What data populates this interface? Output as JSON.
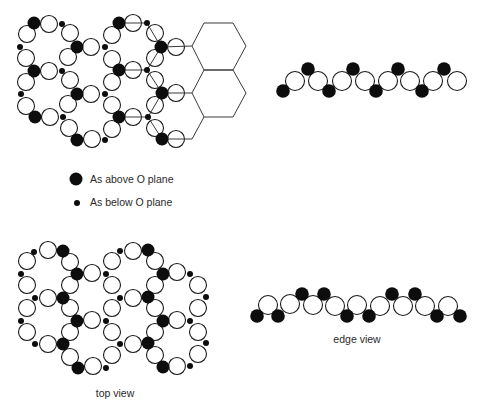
{
  "colors": {
    "background": "#ffffff",
    "atom_fill_dark": "#0d0d0d",
    "open_atom_stroke": "#1a1a1a",
    "open_atom_fill": "#ffffff",
    "bond_line": "#3a3a3a",
    "text": "#2a2a2a"
  },
  "legend": {
    "above_label": "As above O plane",
    "below_label": "As below O plane",
    "above_marker": {
      "x": 76,
      "y": 179,
      "r": 6.5
    },
    "below_marker": {
      "x": 77,
      "y": 203,
      "r": 3
    }
  },
  "labels": {
    "top_view": "top view",
    "edge_view": "edge view"
  },
  "diagram": {
    "groups": [
      {
        "name": "upper-top-view",
        "radii": {
          "open": 8.5,
          "above": 6.5,
          "below": 3
        },
        "open": [
          [
            49,
            24
          ],
          [
            49,
            71
          ],
          [
            50,
            117
          ],
          [
            27,
            34
          ],
          [
            26,
            58
          ],
          [
            26,
            82
          ],
          [
            26,
            106
          ],
          [
            70,
            33
          ],
          [
            68,
            57
          ],
          [
            70,
            80
          ],
          [
            68,
            104
          ],
          [
            69,
            128
          ],
          [
            91,
            47
          ],
          [
            91,
            94
          ],
          [
            92,
            139
          ],
          [
            112,
            35
          ],
          [
            112,
            59
          ],
          [
            112,
            82
          ],
          [
            112,
            105
          ],
          [
            112,
            129
          ],
          [
            133,
            23
          ],
          [
            133,
            70
          ],
          [
            133,
            117
          ],
          [
            155,
            33
          ],
          [
            155,
            58
          ],
          [
            155,
            80
          ],
          [
            155,
            105
          ],
          [
            155,
            128
          ],
          [
            176,
            47
          ],
          [
            176,
            93
          ],
          [
            176,
            139
          ]
        ],
        "above": [
          [
            34,
            23
          ],
          [
            77,
            47
          ],
          [
            34,
            71
          ],
          [
            77,
            94
          ],
          [
            35,
            117
          ],
          [
            77,
            140
          ],
          [
            119,
            23
          ],
          [
            161,
            47
          ],
          [
            119,
            70
          ],
          [
            162,
            93
          ],
          [
            119,
            117
          ],
          [
            162,
            139
          ]
        ],
        "below": [
          [
            62,
            24
          ],
          [
            20,
            47
          ],
          [
            62,
            71
          ],
          [
            21,
            94
          ],
          [
            63,
            117
          ],
          [
            105,
            140
          ],
          [
            147,
            23
          ],
          [
            105,
            47
          ],
          [
            147,
            70
          ],
          [
            105,
            94
          ],
          [
            148,
            117
          ]
        ],
        "bonds": [
          [
            119,
            23,
            147,
            23
          ],
          [
            147,
            23,
            161,
            47
          ],
          [
            161,
            47,
            147,
            70
          ],
          [
            119,
            70,
            147,
            70
          ],
          [
            147,
            70,
            162,
            93
          ],
          [
            162,
            93,
            148,
            117
          ],
          [
            119,
            117,
            148,
            117
          ],
          [
            148,
            117,
            162,
            139
          ],
          [
            161,
            47,
            192,
            46
          ],
          [
            162,
            93,
            192,
            93
          ],
          [
            162,
            139,
            192,
            139
          ],
          [
            204,
            117,
            192,
            139
          ]
        ],
        "hexagons": [
          [
            [
              192,
              46
            ],
            [
              204,
              23
            ],
            [
              233,
              23
            ],
            [
              246,
              46
            ],
            [
              233,
              70
            ],
            [
              204,
              70
            ]
          ],
          [
            [
              204,
              70
            ],
            [
              233,
              70
            ],
            [
              246,
              93
            ],
            [
              233,
              117
            ],
            [
              204,
              117
            ],
            [
              192,
              93
            ]
          ]
        ]
      },
      {
        "name": "upper-edge-view",
        "radii": {
          "open": 9.5,
          "above": 6.8,
          "below": 6.8
        },
        "open": [
          [
            295,
            81
          ],
          [
            318,
            81
          ],
          [
            342,
            81
          ],
          [
            365,
            81
          ],
          [
            388,
            81
          ],
          [
            410,
            81
          ],
          [
            433,
            81
          ],
          [
            457,
            81
          ]
        ],
        "above": [
          [
            308,
            69
          ],
          [
            353,
            69
          ],
          [
            398,
            69
          ],
          [
            444,
            69
          ]
        ],
        "below_dark": [
          [
            283,
            91
          ],
          [
            329,
            91
          ],
          [
            376,
            91
          ],
          [
            422,
            91
          ]
        ],
        "below": [],
        "bonds": [],
        "hexagons": []
      },
      {
        "name": "lower-top-view",
        "radii": {
          "open": 8.5,
          "above": 6.5,
          "below": 3
        },
        "open": [
          [
            48,
            250
          ],
          [
            27,
            261
          ],
          [
            70,
            262
          ],
          [
            92,
            273
          ],
          [
            27,
            285
          ],
          [
            70,
            285
          ],
          [
            48,
            298
          ],
          [
            27,
            308
          ],
          [
            70,
            308
          ],
          [
            92,
            320
          ],
          [
            27,
            332
          ],
          [
            70,
            332
          ],
          [
            48,
            344
          ],
          [
            70,
            357
          ],
          [
            93,
            366
          ],
          [
            133,
            251
          ],
          [
            112,
            261
          ],
          [
            155,
            261
          ],
          [
            177,
            272
          ],
          [
            112,
            285
          ],
          [
            155,
            285
          ],
          [
            133,
            298
          ],
          [
            112,
            308
          ],
          [
            155,
            308
          ],
          [
            177,
            320
          ],
          [
            112,
            332
          ],
          [
            155,
            332
          ],
          [
            133,
            344
          ],
          [
            112,
            355
          ],
          [
            155,
            355
          ],
          [
            177,
            366
          ],
          [
            198,
            285
          ],
          [
            198,
            308
          ],
          [
            198,
            332
          ],
          [
            198,
            354
          ]
        ],
        "above": [
          [
            63,
            251
          ],
          [
            77,
            274
          ],
          [
            63,
            298
          ],
          [
            77,
            321
          ],
          [
            63,
            344
          ],
          [
            78,
            368
          ],
          [
            148,
            250
          ],
          [
            163,
            274
          ],
          [
            148,
            297
          ],
          [
            163,
            321
          ],
          [
            148,
            343
          ],
          [
            163,
            367
          ]
        ],
        "below": [
          [
            34,
            252
          ],
          [
            21,
            274
          ],
          [
            35,
            298
          ],
          [
            21,
            321
          ],
          [
            35,
            344
          ],
          [
            106,
            274
          ],
          [
            106,
            321
          ],
          [
            106,
            368
          ],
          [
            120,
            251
          ],
          [
            120,
            298
          ],
          [
            120,
            344
          ],
          [
            190,
            274
          ],
          [
            190,
            321
          ],
          [
            190,
            366
          ],
          [
            206,
            297
          ],
          [
            206,
            343
          ]
        ],
        "bonds": [],
        "hexagons": []
      },
      {
        "name": "lower-edge-view",
        "radii": {
          "open": 9.5,
          "above": 6.8,
          "below": 6.8
        },
        "open": [
          [
            268,
            305
          ],
          [
            290,
            304
          ],
          [
            313,
            305
          ],
          [
            335,
            306
          ],
          [
            357,
            305
          ],
          [
            380,
            306
          ],
          [
            403,
            306
          ],
          [
            425,
            306
          ],
          [
            448,
            306
          ]
        ],
        "above": [
          [
            302,
            294
          ],
          [
            324,
            294
          ],
          [
            392,
            294
          ],
          [
            415,
            294
          ]
        ],
        "below_dark": [
          [
            257,
            316
          ],
          [
            278,
            316
          ],
          [
            347,
            316
          ],
          [
            369,
            316
          ],
          [
            437,
            316
          ],
          [
            460,
            316
          ]
        ],
        "below": [],
        "bonds": [],
        "hexagons": []
      }
    ]
  }
}
